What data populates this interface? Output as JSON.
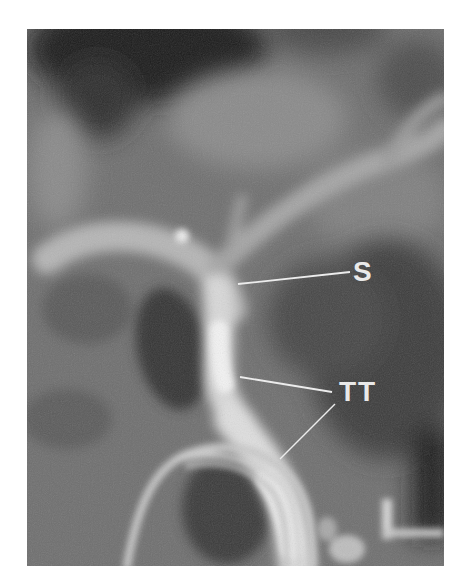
{
  "image": {
    "type": "grayscale radiograph",
    "annotations": [
      {
        "id": "s",
        "text": "S",
        "leader_lines": [
          {
            "x1": 211,
            "y1": 255,
            "x2": 323,
            "y2": 243
          }
        ]
      },
      {
        "id": "tt",
        "text": "TT",
        "leader_lines": [
          {
            "x1": 213,
            "y1": 348,
            "x2": 305,
            "y2": 363
          },
          {
            "x1": 308,
            "y1": 375,
            "x2": 253,
            "y2": 430
          }
        ]
      }
    ],
    "colors": {
      "background": "#6e6e6e",
      "dark_region": "#2a2a2a",
      "bright_vessel": "#e8e8e8",
      "label": "#e9e9e9"
    }
  }
}
